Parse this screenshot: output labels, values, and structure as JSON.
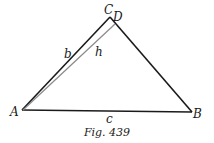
{
  "figure": {
    "caption": "Fig. 439",
    "vertices": {
      "A": {
        "label": "A",
        "x": 22,
        "y": 110
      },
      "B": {
        "label": "B",
        "x": 192,
        "y": 112
      },
      "C": {
        "label": "C",
        "x": 110,
        "y": 17
      },
      "D": {
        "label": "D",
        "x": 115,
        "y": 24
      }
    },
    "sides": {
      "b": {
        "label": "b"
      },
      "c": {
        "label": "c"
      },
      "h": {
        "label": "h"
      }
    },
    "colors": {
      "triangle": "#1a1a1a",
      "altitude": "#8a8a8a"
    }
  }
}
